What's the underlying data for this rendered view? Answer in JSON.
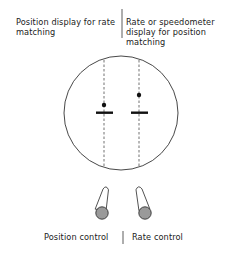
{
  "panels": {
    "left": {
      "title": "Position display for rate matching",
      "control_label": "Position control"
    },
    "right": {
      "title": "Rate or speedometer display for position matching",
      "control_label": "Rate control"
    }
  },
  "display": {
    "shape": "circle",
    "indicators": [
      {
        "name": "left-indicator",
        "dot_above_bar": "small offset"
      },
      {
        "name": "right-indicator",
        "dot_above_bar": "larger offset"
      }
    ]
  },
  "controls": [
    {
      "name": "position-control-lever",
      "tilt": "left"
    },
    {
      "name": "rate-control-lever",
      "tilt": "right"
    }
  ],
  "colors": {
    "line": "#222222",
    "knob": "#9a9a9a"
  }
}
